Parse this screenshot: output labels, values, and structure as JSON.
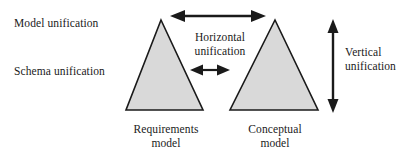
{
  "figure": {
    "type": "diagram",
    "background_color": "#ffffff",
    "stroke_color": "#1a1a1a",
    "triangle_fill_color": "#d9d9d9"
  },
  "annotations": {
    "model_unification": "Model unification",
    "schema_unification": "Schema unification",
    "horizontal_unification": "Horizontal\nunification",
    "vertical_unification": "Vertical\nunification"
  },
  "shapes": {
    "left_triangle": {
      "caption": "Requirements\nmodel",
      "apex_x": 161,
      "apex_y": 20,
      "base_left_x": 126,
      "base_right_x": 203,
      "base_y": 110
    },
    "right_triangle": {
      "caption": "Conceptual\nmodel",
      "apex_x": 275,
      "apex_y": 20,
      "base_left_x": 230,
      "base_right_x": 318,
      "base_y": 110
    }
  },
  "arrows": {
    "top_horizontal": {
      "name": "model-unification-arrow",
      "orientation": "horizontal",
      "double_headed": true,
      "x1": 172,
      "y1": 16,
      "x2": 264,
      "y2": 16
    },
    "mid_horizontal": {
      "name": "schema-unification-arrow",
      "orientation": "horizontal",
      "double_headed": true,
      "x1": 192,
      "y1": 70,
      "x2": 228,
      "y2": 70
    },
    "right_vertical": {
      "name": "vertical-unification-arrow",
      "orientation": "vertical",
      "double_headed": true,
      "x1": 333,
      "y1": 20,
      "x2": 333,
      "y2": 112
    }
  }
}
